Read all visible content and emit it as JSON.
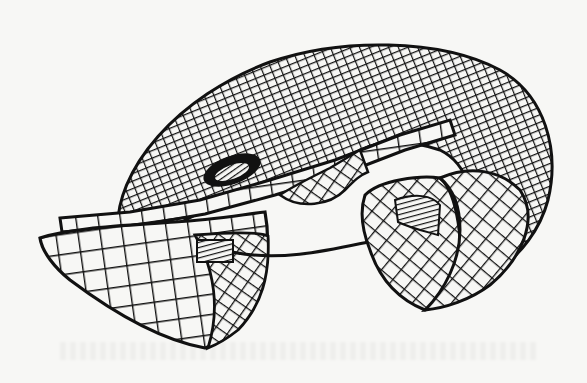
{
  "figure": {
    "description": "Wireframe line drawing of a torus-like 3D surface with a cut-away section, showing a ribbon strip and open tube ends",
    "colors": {
      "ink": "#111111",
      "paper": "#f7f7f5"
    }
  }
}
